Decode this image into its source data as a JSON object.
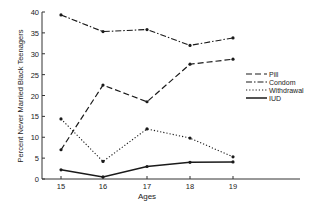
{
  "chart_data": {
    "type": "line",
    "title": "",
    "xlabel": "Ages",
    "ylabel": "Percent Never Married Black Teenagers",
    "categories": [
      "15",
      "16",
      "17",
      "18",
      "19"
    ],
    "x": [
      15,
      16,
      17,
      18,
      19
    ],
    "ylim": [
      0,
      40
    ],
    "yticks": [
      0,
      5,
      10,
      15,
      20,
      25,
      30,
      35,
      40
    ],
    "grid": false,
    "legend_position": "right, middle",
    "series": [
      {
        "name": "Pill",
        "style": "dashed",
        "values": [
          7.0,
          22.5,
          18.5,
          27.5,
          28.7
        ]
      },
      {
        "name": "Condom",
        "style": "dash-dot",
        "values": [
          39.3,
          35.3,
          35.8,
          32.0,
          33.8
        ]
      },
      {
        "name": "Withdrawal",
        "style": "dotted",
        "values": [
          14.4,
          4.2,
          12.0,
          9.8,
          5.3
        ]
      },
      {
        "name": "IUD",
        "style": "solid",
        "values": [
          2.2,
          0.5,
          3.0,
          4.0,
          4.1
        ]
      }
    ]
  },
  "colors": {
    "line": "#1a1a1a",
    "axis": "#333333"
  }
}
